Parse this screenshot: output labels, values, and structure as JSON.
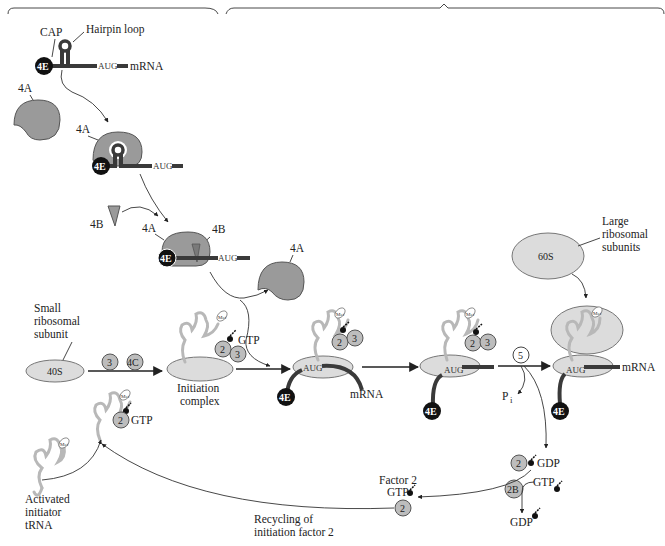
{
  "diagram": {
    "type": "biological-pathway",
    "colors": {
      "mrna": "#3a3a3a",
      "cap_factor_4E": "#111111",
      "factor_4A": "#9a9a9a",
      "initiation_factors": "#bdbdbd",
      "ribosomal_subunits": "#dcdcdc",
      "trna": "#b8b8b8"
    },
    "top_panel": {
      "cap_label": "CAP",
      "hairpin_label": "Hairpin loop",
      "factor_4E": "4E",
      "start_codon": "AUG",
      "mrna_label": "mRNA",
      "factor_4A_free": "4A",
      "factor_4A_bound": "4A",
      "factor_4B_free": "4B",
      "factor_4A_complex": "4A",
      "factor_4B_complex": "4B",
      "factor_4A_released": "4A",
      "step2_aug": "AUG",
      "step3_aug": "AUG",
      "step2_4e": "4E",
      "step3_4e": "4E"
    },
    "small_subunit": {
      "label_line1": "Small",
      "label_line2": "ribosomal",
      "label_line3": "subunit",
      "name": "40S",
      "factor3": "3",
      "factor4C": "4C"
    },
    "initiation_complex": {
      "label_line1": "Initiation",
      "label_line2": "complex",
      "gtp": "GTP",
      "factor2": "2",
      "factor3": "3",
      "met": "Met"
    },
    "scanning_complex": {
      "aug": "AUG",
      "factor4E": "4E",
      "mrna_label": "mRNA",
      "factor2": "2",
      "factor3": "3",
      "met": "Met"
    },
    "aug_complex": {
      "aug": "AUG",
      "factor4E": "4E",
      "factor2": "2",
      "factor3": "3",
      "met": "Met"
    },
    "factor5": {
      "label": "5",
      "pi": "P",
      "pi_sub": "i"
    },
    "large_subunit": {
      "label_line1": "Large",
      "label_line2": "ribosomal",
      "label_line3": "subunits",
      "name": "60S"
    },
    "final_ribosome": {
      "aug": "AUG",
      "factor4E": "4E",
      "mrna_label": "mRNA",
      "met": "Met"
    },
    "recycling": {
      "factor2_gdp": "2",
      "gdp": "GDP",
      "factor2B": "2B",
      "gtp_in": "GTP",
      "gdp_out": "GDP",
      "factor2_label": "Factor 2",
      "factor2_gtp": "GTP",
      "factor2_circle": "2",
      "caption_line1": "Recycling of",
      "caption_line2": "initiation factor 2"
    },
    "activated_trna": {
      "label_line1": "Activated",
      "label_line2": "initiator",
      "label_line3": "tRNA",
      "met": "Met",
      "ternary_factor2": "2",
      "ternary_gtp": "GTP"
    }
  }
}
